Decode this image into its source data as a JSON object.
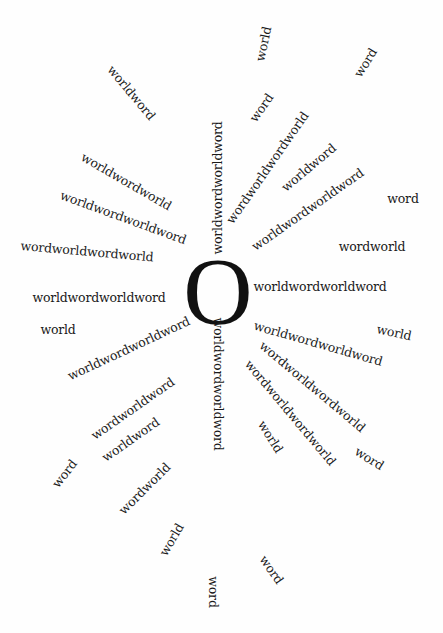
{
  "artwork": {
    "background": "#fefefe",
    "ink": "#1a1a1a",
    "center": {
      "glyph": "O",
      "x": 218,
      "y": 292
    },
    "rays": [
      {
        "text": "worldwordworldword",
        "x": 218,
        "y": 188,
        "angle": -90
      },
      {
        "text": "worldwordworldword",
        "x": 218,
        "y": 384,
        "angle": 90
      },
      {
        "text": "worldword",
        "x": 131,
        "y": 93,
        "angle": 50
      },
      {
        "text": "world",
        "x": 264,
        "y": 44,
        "angle": -78
      },
      {
        "text": "word",
        "x": 366,
        "y": 63,
        "angle": -58
      },
      {
        "text": "word",
        "x": 262,
        "y": 108,
        "angle": -55
      },
      {
        "text": "wordworldwordworld",
        "x": 268,
        "y": 168,
        "angle": -55
      },
      {
        "text": "worldword",
        "x": 309,
        "y": 168,
        "angle": -40
      },
      {
        "text": "worldwordworldword",
        "x": 308,
        "y": 210,
        "angle": -35
      },
      {
        "text": "word",
        "x": 403,
        "y": 199,
        "angle": 0
      },
      {
        "text": "wordworld",
        "x": 372,
        "y": 247,
        "angle": 0
      },
      {
        "text": "worldwordworldword",
        "x": 320,
        "y": 287,
        "angle": 0
      },
      {
        "text": "world",
        "x": 394,
        "y": 333,
        "angle": 12
      },
      {
        "text": "worldwordworldword",
        "x": 318,
        "y": 344,
        "angle": 16
      },
      {
        "text": "wordworldwordworld",
        "x": 312,
        "y": 387,
        "angle": 40
      },
      {
        "text": "wordworldwordworld",
        "x": 290,
        "y": 413,
        "angle": 50
      },
      {
        "text": "world",
        "x": 270,
        "y": 437,
        "angle": 58
      },
      {
        "text": "word",
        "x": 369,
        "y": 459,
        "angle": 32
      },
      {
        "text": "word",
        "x": 271,
        "y": 570,
        "angle": 55
      },
      {
        "text": "word",
        "x": 213,
        "y": 592,
        "angle": 90
      },
      {
        "text": "world",
        "x": 172,
        "y": 540,
        "angle": -60
      },
      {
        "text": "wordworld",
        "x": 145,
        "y": 489,
        "angle": -45
      },
      {
        "text": "worldword",
        "x": 131,
        "y": 440,
        "angle": -35
      },
      {
        "text": "wordworldword",
        "x": 133,
        "y": 409,
        "angle": -35
      },
      {
        "text": "word",
        "x": 65,
        "y": 474,
        "angle": -52
      },
      {
        "text": "worldwordworldword",
        "x": 129,
        "y": 349,
        "angle": -25
      },
      {
        "text": "world",
        "x": 58,
        "y": 330,
        "angle": 0
      },
      {
        "text": "worldwordworldword",
        "x": 99,
        "y": 298,
        "angle": 0
      },
      {
        "text": "wordworldwordworld",
        "x": 87,
        "y": 252,
        "angle": 5
      },
      {
        "text": "worldwordworldword",
        "x": 123,
        "y": 218,
        "angle": 20
      },
      {
        "text": "worldwordworld",
        "x": 126,
        "y": 182,
        "angle": 30
      }
    ]
  }
}
